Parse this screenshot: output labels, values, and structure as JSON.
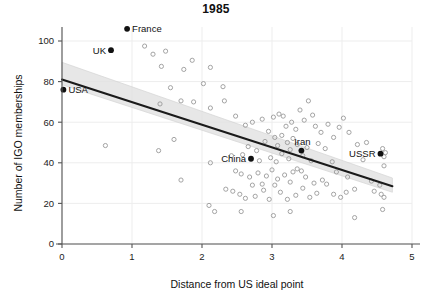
{
  "chart_data": {
    "type": "scatter",
    "title": "1985",
    "xlabel": "Distance from US ideal point",
    "ylabel": "Number of IGO memberships",
    "xlim": [
      0,
      5
    ],
    "ylim": [
      0,
      110
    ],
    "xticks": [
      0,
      1,
      2,
      3,
      4,
      5
    ],
    "yticks": [
      0,
      20,
      40,
      60,
      80,
      100
    ],
    "xtick_labels": [
      "0",
      "1",
      "2",
      "3",
      "4",
      "5"
    ],
    "ytick_labels": [
      "0",
      "20",
      "40",
      "60",
      "80",
      "100"
    ],
    "grid": true,
    "legend": "none",
    "series": [
      {
        "name": "labeled-countries",
        "marker": "filled-circle",
        "color": "#111111",
        "points": [
          {
            "label": "France",
            "x": 0.93,
            "y": 106.0,
            "label_side": "right"
          },
          {
            "label": "UK",
            "x": 0.7,
            "y": 95.5,
            "label_side": "left"
          },
          {
            "label": "USA",
            "x": 0.02,
            "y": 76.0,
            "label_side": "right"
          },
          {
            "label": "China",
            "x": 2.7,
            "y": 42.0,
            "label_side": "left"
          },
          {
            "label": "Iran",
            "x": 3.42,
            "y": 46.0,
            "label_side": "above"
          },
          {
            "label": "USSR",
            "x": 4.55,
            "y": 44.5,
            "label_side": "left"
          }
        ]
      },
      {
        "name": "other-countries",
        "marker": "open-circle",
        "color": "#9a9a9a",
        "points": [
          {
            "x": 1.18,
            "y": 97.5
          },
          {
            "x": 1.3,
            "y": 93.5
          },
          {
            "x": 1.48,
            "y": 95.0
          },
          {
            "x": 1.86,
            "y": 90.5
          },
          {
            "x": 1.74,
            "y": 86.0
          },
          {
            "x": 2.12,
            "y": 87.0
          },
          {
            "x": 1.42,
            "y": 87.5
          },
          {
            "x": 1.55,
            "y": 77.0
          },
          {
            "x": 2.02,
            "y": 79.0
          },
          {
            "x": 2.3,
            "y": 77.5
          },
          {
            "x": 1.4,
            "y": 69.0
          },
          {
            "x": 1.7,
            "y": 70.5
          },
          {
            "x": 1.88,
            "y": 70.0
          },
          {
            "x": 2.32,
            "y": 70.5
          },
          {
            "x": 2.12,
            "y": 67.0
          },
          {
            "x": 2.48,
            "y": 63.0
          },
          {
            "x": 2.62,
            "y": 58.5
          },
          {
            "x": 2.72,
            "y": 60.0
          },
          {
            "x": 2.86,
            "y": 61.5
          },
          {
            "x": 2.95,
            "y": 55.5
          },
          {
            "x": 3.02,
            "y": 62.5
          },
          {
            "x": 3.1,
            "y": 64.0
          },
          {
            "x": 3.16,
            "y": 63.0
          },
          {
            "x": 3.2,
            "y": 58.0
          },
          {
            "x": 3.28,
            "y": 60.0
          },
          {
            "x": 3.34,
            "y": 56.5
          },
          {
            "x": 3.4,
            "y": 66.0
          },
          {
            "x": 3.46,
            "y": 61.0
          },
          {
            "x": 3.52,
            "y": 70.5
          },
          {
            "x": 3.58,
            "y": 63.5
          },
          {
            "x": 3.62,
            "y": 58.0
          },
          {
            "x": 3.7,
            "y": 55.0
          },
          {
            "x": 3.8,
            "y": 59.0
          },
          {
            "x": 3.88,
            "y": 52.5
          },
          {
            "x": 4.02,
            "y": 62.0
          },
          {
            "x": 4.1,
            "y": 55.0
          },
          {
            "x": 3.96,
            "y": 57.5
          },
          {
            "x": 3.3,
            "y": 52.0
          },
          {
            "x": 3.04,
            "y": 52.5
          },
          {
            "x": 2.9,
            "y": 50.5
          },
          {
            "x": 3.08,
            "y": 48.5
          },
          {
            "x": 3.22,
            "y": 50.0
          },
          {
            "x": 3.36,
            "y": 49.0
          },
          {
            "x": 3.5,
            "y": 47.5
          },
          {
            "x": 3.66,
            "y": 49.5
          },
          {
            "x": 3.76,
            "y": 47.0
          },
          {
            "x": 4.22,
            "y": 49.0
          },
          {
            "x": 4.35,
            "y": 50.0
          },
          {
            "x": 4.58,
            "y": 47.0
          },
          {
            "x": 4.62,
            "y": 45.0
          },
          {
            "x": 4.6,
            "y": 43.0
          },
          {
            "x": 0.62,
            "y": 48.5
          },
          {
            "x": 1.38,
            "y": 46.0
          },
          {
            "x": 1.6,
            "y": 51.5
          },
          {
            "x": 2.12,
            "y": 40.0
          },
          {
            "x": 2.42,
            "y": 43.5
          },
          {
            "x": 2.58,
            "y": 44.0
          },
          {
            "x": 2.82,
            "y": 41.0
          },
          {
            "x": 2.98,
            "y": 42.5
          },
          {
            "x": 3.06,
            "y": 40.5
          },
          {
            "x": 3.14,
            "y": 44.5
          },
          {
            "x": 3.24,
            "y": 42.0
          },
          {
            "x": 3.44,
            "y": 43.5
          },
          {
            "x": 3.56,
            "y": 41.0
          },
          {
            "x": 3.86,
            "y": 40.5
          },
          {
            "x": 4.3,
            "y": 41.5
          },
          {
            "x": 4.6,
            "y": 38.5
          },
          {
            "x": 2.48,
            "y": 36.0
          },
          {
            "x": 2.56,
            "y": 34.5
          },
          {
            "x": 2.68,
            "y": 33.0
          },
          {
            "x": 2.8,
            "y": 35.0
          },
          {
            "x": 2.92,
            "y": 33.5
          },
          {
            "x": 3.0,
            "y": 36.5
          },
          {
            "x": 3.08,
            "y": 32.0
          },
          {
            "x": 3.18,
            "y": 34.0
          },
          {
            "x": 3.26,
            "y": 30.5
          },
          {
            "x": 3.36,
            "y": 37.0
          },
          {
            "x": 3.48,
            "y": 33.0
          },
          {
            "x": 3.6,
            "y": 30.0
          },
          {
            "x": 3.72,
            "y": 31.5
          },
          {
            "x": 1.7,
            "y": 31.5
          },
          {
            "x": 2.34,
            "y": 27.0
          },
          {
            "x": 2.44,
            "y": 26.0
          },
          {
            "x": 2.54,
            "y": 24.5
          },
          {
            "x": 2.62,
            "y": 22.5
          },
          {
            "x": 2.76,
            "y": 23.5
          },
          {
            "x": 2.88,
            "y": 26.5
          },
          {
            "x": 2.96,
            "y": 22.0
          },
          {
            "x": 3.04,
            "y": 29.0
          },
          {
            "x": 3.12,
            "y": 25.5
          },
          {
            "x": 3.22,
            "y": 22.0
          },
          {
            "x": 3.34,
            "y": 24.0
          },
          {
            "x": 3.44,
            "y": 27.5
          },
          {
            "x": 3.54,
            "y": 23.0
          },
          {
            "x": 3.64,
            "y": 25.0
          },
          {
            "x": 3.78,
            "y": 29.5
          },
          {
            "x": 3.88,
            "y": 24.5
          },
          {
            "x": 3.98,
            "y": 23.0
          },
          {
            "x": 4.06,
            "y": 25.5
          },
          {
            "x": 4.18,
            "y": 27.0
          },
          {
            "x": 4.46,
            "y": 26.0
          },
          {
            "x": 4.56,
            "y": 24.5
          },
          {
            "x": 4.6,
            "y": 23.0
          },
          {
            "x": 2.1,
            "y": 19.0
          },
          {
            "x": 2.18,
            "y": 16.0
          },
          {
            "x": 2.56,
            "y": 16.0
          },
          {
            "x": 3.02,
            "y": 14.0
          },
          {
            "x": 3.26,
            "y": 16.0
          },
          {
            "x": 4.18,
            "y": 13.0
          },
          {
            "x": 4.58,
            "y": 17.0
          },
          {
            "x": 2.72,
            "y": 29.0
          },
          {
            "x": 2.86,
            "y": 29.5
          },
          {
            "x": 3.3,
            "y": 35.5
          },
          {
            "x": 3.42,
            "y": 36.0
          },
          {
            "x": 4.42,
            "y": 31.0
          },
          {
            "x": 4.54,
            "y": 29.0
          },
          {
            "x": 3.14,
            "y": 53.5
          },
          {
            "x": 3.26,
            "y": 46.5
          },
          {
            "x": 2.66,
            "y": 48.0
          },
          {
            "x": 2.78,
            "y": 46.0
          },
          {
            "x": 3.92,
            "y": 35.5
          },
          {
            "x": 4.08,
            "y": 33.0
          }
        ]
      }
    ],
    "regression": {
      "name": "linear-fit",
      "color": "#1a1a1a",
      "x_start": 0.0,
      "y_start": 81.0,
      "x_end": 4.72,
      "y_end": 28.5,
      "band_color": "#e3e3e3",
      "band_upper_start": 89.5,
      "band_lower_start": 78.5,
      "band_upper_end": 32.5,
      "band_lower_end": 25.5
    }
  }
}
